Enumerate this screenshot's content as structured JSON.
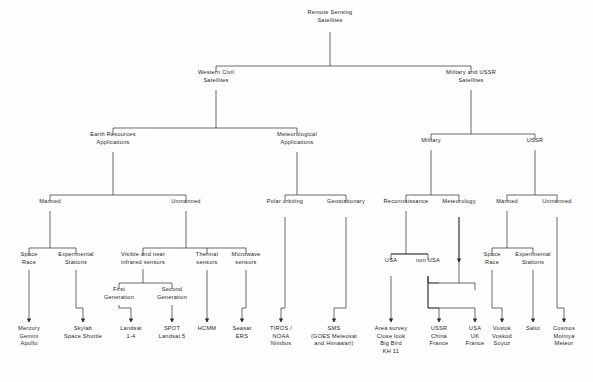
{
  "diagram": {
    "type": "hierarchy-tree",
    "line_color": "#2b2b2b",
    "text_color": "#1c1c1c",
    "background": "#fefefe",
    "nodes": [
      {
        "id": "root",
        "lines": [
          "Remote Sensing",
          "Satellites"
        ],
        "x": 330,
        "y": 14
      },
      {
        "id": "western",
        "lines": [
          "Western  Civil",
          "Satellites"
        ],
        "x": 216,
        "y": 74
      },
      {
        "id": "milussr",
        "lines": [
          "Military  and  USSR",
          "Satellites"
        ],
        "x": 471,
        "y": 74
      },
      {
        "id": "earthres",
        "lines": [
          "Earth  Resources",
          "Applications"
        ],
        "x": 113,
        "y": 136
      },
      {
        "id": "meteoapp",
        "lines": [
          "Meteorological",
          "Applications"
        ],
        "x": 297,
        "y": 136
      },
      {
        "id": "military",
        "lines": [
          "Military"
        ],
        "x": 431,
        "y": 142
      },
      {
        "id": "ussr",
        "lines": [
          "USSR"
        ],
        "x": 535,
        "y": 142
      },
      {
        "id": "manned",
        "lines": [
          "Manned"
        ],
        "x": 50,
        "y": 203
      },
      {
        "id": "unmanned",
        "lines": [
          "Unmanned"
        ],
        "x": 186,
        "y": 203
      },
      {
        "id": "polar",
        "lines": [
          "Polar  orbiting"
        ],
        "x": 285,
        "y": 203
      },
      {
        "id": "geo",
        "lines": [
          "Geostationary"
        ],
        "x": 346,
        "y": 203
      },
      {
        "id": "recon",
        "lines": [
          "Reconnaissance"
        ],
        "x": 406,
        "y": 203
      },
      {
        "id": "meteorology",
        "lines": [
          "Meteorology"
        ],
        "x": 459,
        "y": 203
      },
      {
        "id": "ussrmanned",
        "lines": [
          "Manned"
        ],
        "x": 507,
        "y": 203
      },
      {
        "id": "ussrunmanned",
        "lines": [
          "Unmanned"
        ],
        "x": 557,
        "y": 203
      },
      {
        "id": "spacerace1",
        "lines": [
          "Space",
          "Race"
        ],
        "x": 29,
        "y": 256
      },
      {
        "id": "expstations1",
        "lines": [
          "Experimental",
          "Stations"
        ],
        "x": 76,
        "y": 256
      },
      {
        "id": "visnir",
        "lines": [
          "Visible  and  near",
          "infrared  sensors"
        ],
        "x": 143,
        "y": 256
      },
      {
        "id": "thermal",
        "lines": [
          "Thermal",
          "sensors"
        ],
        "x": 207,
        "y": 256
      },
      {
        "id": "microwave",
        "lines": [
          "Microwave",
          "sensors"
        ],
        "x": 246,
        "y": 256
      },
      {
        "id": "usa",
        "lines": [
          "USA"
        ],
        "x": 391,
        "y": 262
      },
      {
        "id": "nonusa",
        "lines": [
          "non  USA"
        ],
        "x": 428,
        "y": 262
      },
      {
        "id": "spacerace2",
        "lines": [
          "Space",
          "Race"
        ],
        "x": 492,
        "y": 256
      },
      {
        "id": "expstations2",
        "lines": [
          "Experimental",
          "Stations"
        ],
        "x": 533,
        "y": 256
      },
      {
        "id": "firstgen",
        "lines": [
          "First",
          "Generation"
        ],
        "x": 119,
        "y": 291
      },
      {
        "id": "secondgen",
        "lines": [
          "Second",
          "Generation"
        ],
        "x": 172,
        "y": 291
      },
      {
        "id": "mercury",
        "lines": [
          "Mercury",
          "Gemini",
          "Apollo"
        ],
        "x": 29,
        "y": 330
      },
      {
        "id": "skylab",
        "lines": [
          "Skylab",
          "Space  Shuttle"
        ],
        "x": 83,
        "y": 330
      },
      {
        "id": "landsat14",
        "lines": [
          "Landsat",
          "1-4"
        ],
        "x": 131,
        "y": 330
      },
      {
        "id": "spot",
        "lines": [
          "SPOT",
          "Landsat  5"
        ],
        "x": 172,
        "y": 330
      },
      {
        "id": "hcmm",
        "lines": [
          "HCMM"
        ],
        "x": 207,
        "y": 330
      },
      {
        "id": "seasat",
        "lines": [
          "Seasat",
          "ERS"
        ],
        "x": 242,
        "y": 330
      },
      {
        "id": "tiros",
        "lines": [
          "TIROS /",
          "NOAA",
          "Nimbus"
        ],
        "x": 281,
        "y": 330
      },
      {
        "id": "sms",
        "lines": [
          "SMS",
          "(GOES  Meteosat",
          "and  Himawari)"
        ],
        "x": 334,
        "y": 330
      },
      {
        "id": "areasurvey",
        "lines": [
          "Area   survey",
          "Close  look",
          "Big  Bird",
          "KH 11"
        ],
        "x": 391,
        "y": 330
      },
      {
        "id": "ussrchina",
        "lines": [
          "USSR",
          "China",
          "France"
        ],
        "x": 439,
        "y": 330
      },
      {
        "id": "usauk",
        "lines": [
          "USA",
          "UK",
          "France"
        ],
        "x": 475,
        "y": 330
      },
      {
        "id": "vostok",
        "lines": [
          "Vostok",
          "Voskod",
          "Soyuz"
        ],
        "x": 502,
        "y": 330
      },
      {
        "id": "salut",
        "lines": [
          "Salut"
        ],
        "x": 533,
        "y": 330
      },
      {
        "id": "cosmos",
        "lines": [
          "Cosmos",
          "Molniya",
          "Meteor"
        ],
        "x": 564,
        "y": 330
      }
    ],
    "edges": [
      {
        "from": "root",
        "to": [
          "western",
          "milussr"
        ],
        "stem": 32,
        "bus": 66,
        "child_top": 66
      },
      {
        "from": "western",
        "to": [
          "earthres",
          "meteoapp"
        ],
        "stem": 90,
        "bus": 128,
        "child_top": 128
      },
      {
        "from": "milussr",
        "to": [
          "military",
          "ussr"
        ],
        "stem": 90,
        "bus": 134,
        "child_top": 134
      },
      {
        "from": "earthres",
        "to": [
          "manned",
          "unmanned"
        ],
        "stem": 152,
        "bus": 195,
        "child_top": 195
      },
      {
        "from": "meteoapp",
        "to": [
          "polar",
          "geo"
        ],
        "stem": 152,
        "bus": 195,
        "child_top": 195
      },
      {
        "from": "military",
        "to": [
          "recon",
          "meteorology"
        ],
        "stem": 150,
        "bus": 195,
        "child_top": 195
      },
      {
        "from": "ussr",
        "to": [
          "ussrmanned",
          "ussrunmanned"
        ],
        "stem": 150,
        "bus": 195,
        "child_top": 195
      },
      {
        "from": "manned",
        "to": [
          "spacerace1",
          "expstations1"
        ],
        "stem": 211,
        "bus": 248,
        "child_top": 248
      },
      {
        "from": "unmanned",
        "to": [
          "visnir",
          "thermal",
          "microwave"
        ],
        "stem": 211,
        "bus": 248,
        "child_top": 248
      },
      {
        "from": "recon",
        "to": [
          "usa",
          "nonusa"
        ],
        "stem": 211,
        "bus": 254,
        "child_top": 254
      },
      {
        "from": "ussrmanned",
        "to": [
          "spacerace2",
          "expstations2"
        ],
        "stem": 211,
        "bus": 248,
        "child_top": 248
      },
      {
        "from": "visnir",
        "to": [
          "firstgen",
          "secondgen"
        ],
        "stem": 269,
        "bus": 283,
        "child_top": 283
      }
    ],
    "arrows": [
      {
        "from": "spacerace1",
        "to": "mercury",
        "x": 29,
        "from_y": 270,
        "to_y": 322
      },
      {
        "from": "expstations1",
        "to": "skylab",
        "x": 83,
        "from_y": 270,
        "to_y": 322,
        "from_x": 76
      },
      {
        "from": "firstgen",
        "to": "landsat14",
        "x": 131,
        "from_y": 305,
        "to_y": 322,
        "from_x": 119
      },
      {
        "from": "secondgen",
        "to": "spot",
        "x": 172,
        "from_y": 305,
        "to_y": 322
      },
      {
        "from": "thermal",
        "to": "hcmm",
        "x": 207,
        "from_y": 270,
        "to_y": 322
      },
      {
        "from": "microwave",
        "to": "seasat",
        "x": 242,
        "from_y": 270,
        "to_y": 322,
        "from_x": 246
      },
      {
        "from": "polar",
        "to": "tiros",
        "x": 281,
        "from_y": 217,
        "to_y": 322,
        "from_x": 285
      },
      {
        "from": "geo",
        "to": "sms",
        "x": 334,
        "from_y": 217,
        "to_y": 322,
        "from_x": 346
      },
      {
        "from": "usa",
        "to": "areasurvey",
        "x": 391,
        "from_y": 276,
        "to_y": 322
      },
      {
        "from": "nonusa",
        "to": "ussrchina",
        "x": 439,
        "from_y": 276,
        "to_y": 322,
        "from_x": 428
      },
      {
        "from": "nonusa",
        "to": "usauk",
        "x": 475,
        "from_y": 276,
        "to_y": 322,
        "from_x": 428
      },
      {
        "from": "meteorology",
        "to": "usauk2",
        "x": 459,
        "from_y": 217,
        "to_y": 262
      },
      {
        "from": "spacerace2",
        "to": "vostok",
        "x": 502,
        "from_y": 270,
        "to_y": 322,
        "from_x": 492
      },
      {
        "from": "expstations2",
        "to": "salut",
        "x": 533,
        "from_y": 270,
        "to_y": 322
      },
      {
        "from": "ussrunmanned",
        "to": "cosmos",
        "x": 564,
        "from_y": 217,
        "to_y": 322,
        "from_x": 557
      }
    ],
    "extra_paths": [
      {
        "name": "meteorology-to-nonusa-bus",
        "d": "M 459 217 L 459 254"
      },
      {
        "name": "recon-fan-left",
        "d": "M 391 254 L 428 254"
      },
      {
        "name": "nonusa-fan",
        "d": "M 428 276 L 428 283 L 439 283 M 428 283 L 475 283 L 475 290"
      },
      {
        "name": "meteo-fan",
        "d": "M 459 254 L 459 283"
      }
    ]
  }
}
